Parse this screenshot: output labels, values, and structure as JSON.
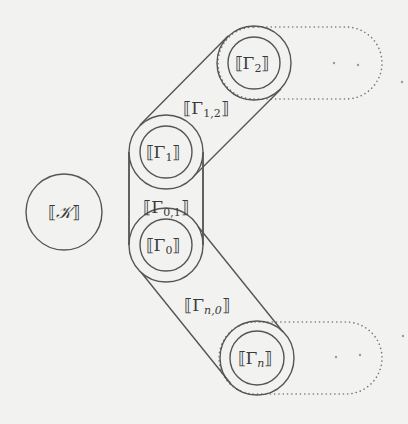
{
  "diagram": {
    "nodes": {
      "K": {
        "label": "⟦𝒦⟧",
        "open": "⟦",
        "sym": "𝒦",
        "close": "⟧"
      },
      "G1": {
        "open": "⟦",
        "sym": "Γ",
        "sub": "1",
        "close": "⟧"
      },
      "G2": {
        "open": "⟦",
        "sym": "Γ",
        "sub": "2",
        "close": "⟧"
      },
      "G0": {
        "open": "⟦",
        "sym": "Γ",
        "sub": "0",
        "close": "⟧"
      },
      "Gn": {
        "open": "⟦",
        "sym": "Γ",
        "sub": "n",
        "close": "⟧"
      }
    },
    "edges": {
      "G12": {
        "open": "⟦",
        "sym": "Γ",
        "sub": "1,2",
        "close": "⟧"
      },
      "G01": {
        "open": "⟦",
        "sym": "Γ",
        "sub": "0,1",
        "close": "⟧"
      },
      "Gn0": {
        "open": "⟦",
        "sym": "Γ",
        "sub": "n,0",
        "close": "⟧"
      }
    },
    "colors": {
      "background": "#f2f2f0",
      "stroke": "#555555",
      "dotted": "#777777",
      "text": "#3a3a3a"
    }
  }
}
